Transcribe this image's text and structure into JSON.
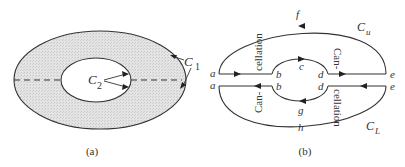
{
  "figure_a": {
    "caption": "(a)",
    "labels": {
      "c1": "C",
      "c1_sub": "1",
      "c2": "C",
      "c2_sub": "2"
    },
    "fill_color": "#d9d9d9",
    "stroke_color": "#333333"
  },
  "figure_b": {
    "caption": "(b)",
    "points": {
      "a_top": "a",
      "a_bottom": "a",
      "b_top": "b",
      "b_bottom": "b",
      "c": "c",
      "d_top": "d",
      "d_bottom": "d",
      "e_top": "e",
      "e_bottom": "e",
      "f": "f",
      "g": "g",
      "h": "h"
    },
    "contours": {
      "upper": "C",
      "upper_sub": "u",
      "lower": "C",
      "lower_sub": "L"
    },
    "annotations": {
      "upper_left": "cellation",
      "upper_right": "Can-",
      "lower_left": "Can-",
      "lower_right": "cellation"
    }
  }
}
